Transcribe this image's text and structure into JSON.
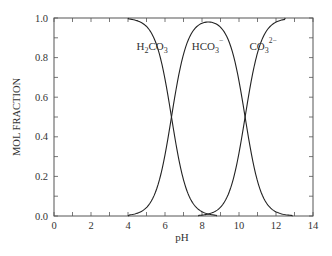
{
  "chart_data": {
    "type": "line",
    "title": "",
    "xlabel": "pH",
    "ylabel": "MOL FRACTION",
    "xlim": [
      0,
      14
    ],
    "ylim": [
      0.0,
      1.0
    ],
    "x_ticks": [
      "0",
      "2",
      "4",
      "6",
      "8",
      "10",
      "12",
      "14"
    ],
    "y_ticks": [
      "0.0",
      "0.2",
      "0.4",
      "0.6",
      "0.8",
      "1.0"
    ],
    "grid": false,
    "legend": "inline labels",
    "pKa1": 6.35,
    "pKa2": 10.33,
    "series": [
      {
        "name": "H2CO3",
        "label_main": "H",
        "label_parts": [
          {
            "t": "H"
          },
          {
            "t": "2",
            "sub": true
          },
          {
            "t": "CO"
          },
          {
            "t": "3",
            "sub": true
          }
        ],
        "x": [
          4.0,
          5.0,
          5.5,
          6.0,
          6.35,
          6.7,
          7.0,
          7.5,
          8.0,
          8.5,
          8.8
        ],
        "values": [
          1.0,
          0.96,
          0.88,
          0.69,
          0.5,
          0.31,
          0.18,
          0.07,
          0.02,
          0.01,
          0.0
        ]
      },
      {
        "name": "HCO3-",
        "label_parts": [
          {
            "t": "HCO"
          },
          {
            "t": "3",
            "sub": true
          },
          {
            "t": "−",
            "sup": true
          }
        ],
        "x": [
          4.0,
          5.0,
          5.5,
          6.0,
          6.35,
          7.0,
          8.0,
          8.34,
          9.0,
          10.0,
          10.33,
          11.0,
          11.5,
          12.0,
          12.9
        ],
        "values": [
          0.0,
          0.04,
          0.12,
          0.31,
          0.5,
          0.82,
          0.97,
          0.98,
          0.94,
          0.68,
          0.5,
          0.18,
          0.06,
          0.02,
          0.0
        ]
      },
      {
        "name": "CO3 2-",
        "label_parts": [
          {
            "t": "CO"
          },
          {
            "t": "3",
            "sub": true
          },
          {
            "t": "2−",
            "sup": true
          }
        ],
        "x": [
          7.8,
          8.5,
          9.0,
          9.5,
          10.0,
          10.33,
          10.7,
          11.0,
          11.5,
          12.0,
          12.5
        ],
        "values": [
          0.0,
          0.01,
          0.05,
          0.13,
          0.32,
          0.5,
          0.7,
          0.82,
          0.94,
          0.98,
          1.0
        ]
      }
    ],
    "annotations": [
      {
        "text": "H2CO3",
        "x": 5.3,
        "y": 0.86
      },
      {
        "text": "HCO3-",
        "x": 8.3,
        "y": 0.86
      },
      {
        "text": "CO3 2-",
        "x": 11.3,
        "y": 0.86
      }
    ]
  }
}
